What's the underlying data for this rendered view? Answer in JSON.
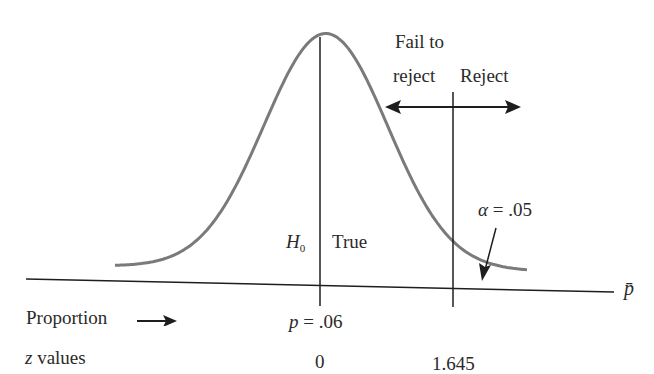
{
  "diagram": {
    "type": "hypothesis-test-normal-curve",
    "region_labels": {
      "fail_to_reject_line1": "Fail to",
      "fail_to_reject_line2": "reject",
      "reject": "Reject"
    },
    "alpha_label": {
      "symbol": "α",
      "text": "= .05",
      "value": 0.05
    },
    "null_hypothesis": {
      "symbol": "H",
      "subscript": "0",
      "status": "True"
    },
    "axis_label": "p̄",
    "rows": [
      {
        "label": "Proportion",
        "arrow": "→"
      },
      {
        "label": "z values",
        "label_italic_prefix": "z",
        "label_rest": "values",
        "arrow": "→"
      }
    ],
    "proportion_value": {
      "symbol": "p",
      "text": "= .06",
      "value": 0.06
    },
    "z_values": {
      "center": "0",
      "critical": "1.645"
    },
    "colors": {
      "curve": "#7a7a7a",
      "lines": "#1e1e1e",
      "text": "#2a2a2a"
    }
  }
}
